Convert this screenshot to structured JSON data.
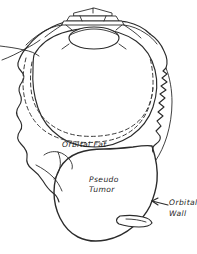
{
  "figure": {
    "style": "hand-drawn pen-and-ink medical illustration",
    "background_color": "#ffffff",
    "ink_color": "#2b2b2b",
    "hatch_color": "#1f1f1f",
    "canvas": {
      "width": 197,
      "height": 254
    }
  },
  "labels": {
    "orbital_fat": "Orbital Fat",
    "pseudo_tumor_line1": "Pseudo",
    "pseudo_tumor_line2": "Tumor",
    "orbital_wall_line1": "Orbital",
    "orbital_wall_line2": "Wall"
  },
  "annotations": {
    "leader_arrow": "arrow pointing left from 'Orbital Wall' text toward the orbital wall contour"
  },
  "structures": [
    {
      "name": "eyelids-and-cornea",
      "description": "upper structure: lid margins drawn as stacked horizontal bands above the cornea"
    },
    {
      "name": "lens",
      "description": "ellipse representing the lens behind the cornea"
    },
    {
      "name": "globe",
      "description": "large rounded eyeball contour occupying the upper two thirds"
    },
    {
      "name": "globe-dashed-outline",
      "description": "dashed curve indicating the posterior globe / orbital rim projection"
    },
    {
      "name": "orbital-wall-left",
      "description": "wavy irregular bone contour down the left side"
    },
    {
      "name": "orbital-wall-right",
      "description": "jagged irregular bone contour down the right side"
    },
    {
      "name": "orbital-fat-region",
      "description": "unshaded area between globe and orbital walls"
    },
    {
      "name": "pseudo-tumor-mass",
      "description": "diagonally cross-hatched mass in the inferior orbit"
    },
    {
      "name": "tumor-tongue",
      "description": "small unshaded flap projecting from the lower right of the mass"
    }
  ]
}
